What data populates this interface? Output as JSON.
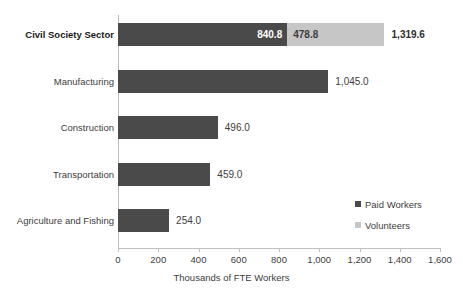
{
  "chart_data": {
    "type": "bar",
    "orientation": "horizontal",
    "stacked": true,
    "title": "",
    "xlabel": "Thousands of FTE Workers",
    "ylabel": "",
    "xlim": [
      0,
      1600
    ],
    "xticks": [
      0,
      200,
      400,
      600,
      800,
      1000,
      1200,
      1400,
      1600
    ],
    "xtick_labels": [
      "0",
      "200",
      "400",
      "600",
      "800",
      "1,000",
      "1,200",
      "1,400",
      "1,600"
    ],
    "grid": false,
    "legend_position": "center-right",
    "categories": [
      "Civil Society Sector",
      "Manufacturing",
      "Construction",
      "Transportation",
      "Agriculture and Fishing"
    ],
    "series": [
      {
        "name": "Paid Workers",
        "color": "#4a4a4a",
        "values": [
          840.8,
          1045.0,
          496.0,
          459.0,
          254.0
        ]
      },
      {
        "name": "Volunteers",
        "color": "#c6c6c6",
        "values": [
          478.8,
          0,
          0,
          0,
          0
        ]
      }
    ],
    "bars": [
      {
        "category": "Civil Society Sector",
        "emphasis": true,
        "paid": 840.8,
        "paid_label": "840.8",
        "volunteers": 478.8,
        "volunteers_label": "478.8",
        "total": 1319.6,
        "total_label": "1,319.6"
      },
      {
        "category": "Manufacturing",
        "emphasis": false,
        "paid": 1045.0,
        "paid_label": "1,045.0",
        "volunteers": 0,
        "volunteers_label": "",
        "total": 1045.0,
        "total_label": "1,045.0"
      },
      {
        "category": "Construction",
        "emphasis": false,
        "paid": 496.0,
        "paid_label": "496.0",
        "volunteers": 0,
        "volunteers_label": "",
        "total": 496.0,
        "total_label": "496.0"
      },
      {
        "category": "Transportation",
        "emphasis": false,
        "paid": 459.0,
        "paid_label": "459.0",
        "volunteers": 0,
        "volunteers_label": "",
        "total": 459.0,
        "total_label": "459.0"
      },
      {
        "category": "Agriculture and Fishing",
        "emphasis": false,
        "paid": 254.0,
        "paid_label": "254.0",
        "volunteers": 0,
        "volunteers_label": "",
        "total": 254.0,
        "total_label": "254.0"
      }
    ],
    "legend": [
      {
        "label": "Paid Workers",
        "color": "#4a4a4a"
      },
      {
        "label": "Volunteers",
        "color": "#c6c6c6"
      }
    ]
  }
}
